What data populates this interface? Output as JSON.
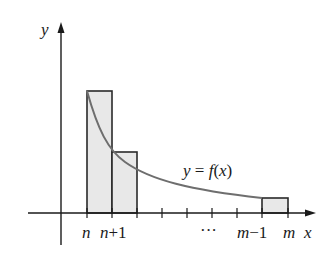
{
  "diagram": {
    "axis_labels": {
      "x": "x",
      "y": "y"
    },
    "curve_label": "y = f(x)",
    "curve_label_parts": {
      "lhs": "y",
      "eq": " = ",
      "f": "f",
      "open": "(",
      "arg": "x",
      "close": ")"
    },
    "tick_labels": {
      "n": "n",
      "n_plus_1_var": "n",
      "n_plus_1_rest": "+1",
      "dots": "···",
      "m_minus_1_var": "m",
      "m_minus_1_rest": "−1",
      "m": "m"
    },
    "rectangles": [
      {
        "name": "rect-n",
        "x_from": "n",
        "x_to": "n+1"
      },
      {
        "name": "rect-n-plus-1",
        "x_from": "n+1",
        "x_to": "n+2"
      },
      {
        "name": "rect-m-minus-1",
        "x_from": "m-1",
        "x_to": "m"
      }
    ],
    "colors": {
      "fill": "#e8e8e8",
      "stroke": "#2a2a2a",
      "curve": "#6e6e6e",
      "axis": "#1a1a1a"
    }
  }
}
